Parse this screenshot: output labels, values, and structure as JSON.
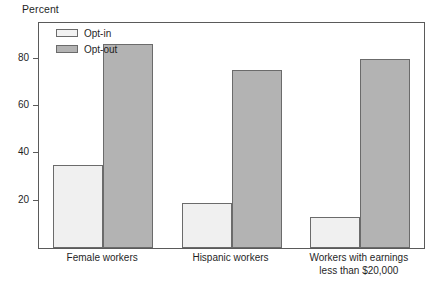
{
  "chart_data": {
    "type": "bar",
    "title": "",
    "ylabel": "Percent",
    "xlabel": "",
    "ylim": [
      0,
      95
    ],
    "yticks": [
      20,
      40,
      60,
      80
    ],
    "grid": false,
    "legend_position": "top-left",
    "categories": [
      "Female workers",
      "Hispanic workers",
      "Workers with earnings\nless than $20,000"
    ],
    "series": [
      {
        "name": "Opt-in",
        "color": "#f0f0f0",
        "values": [
          35,
          19,
          13
        ]
      },
      {
        "name": "Opt-out",
        "color": "#b3b3b3",
        "values": [
          86,
          75,
          80
        ]
      }
    ]
  },
  "legend": {
    "items": [
      {
        "label": "Opt-in",
        "swatch": "optin"
      },
      {
        "label": "Opt-out",
        "swatch": "optout"
      }
    ]
  },
  "axis": {
    "y_title": "Percent",
    "y_tick_labels": [
      "80",
      "60",
      "40",
      "20"
    ]
  },
  "groups": [
    {
      "label": "Female workers"
    },
    {
      "label": "Hispanic workers"
    },
    {
      "label": "Workers with earnings\nless than $20,000"
    }
  ]
}
